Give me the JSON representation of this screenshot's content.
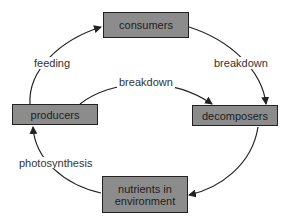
{
  "diagram": {
    "type": "cycle",
    "nodes": [
      {
        "id": "consumers",
        "label": "consumers"
      },
      {
        "id": "producers",
        "label": "producers"
      },
      {
        "id": "decomposers",
        "label": "decomposers"
      },
      {
        "id": "nutrients",
        "label": "nutrients in environment",
        "line1": "nutrients in",
        "line2": "environment"
      }
    ],
    "edges": [
      {
        "from": "producers",
        "to": "consumers",
        "label": "feeding"
      },
      {
        "from": "consumers",
        "to": "decomposers",
        "label": "breakdown"
      },
      {
        "from": "producers",
        "to": "decomposers",
        "label": "breakdown"
      },
      {
        "from": "decomposers",
        "to": "nutrients",
        "label": ""
      },
      {
        "from": "nutrients",
        "to": "producers",
        "label": "photosynthesis"
      }
    ],
    "colors": {
      "box_fill": "#8c8c8c",
      "box_border": "#222222",
      "line": "#222222"
    }
  }
}
